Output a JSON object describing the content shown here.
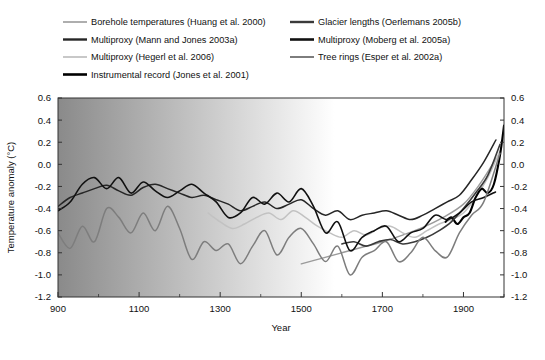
{
  "chart_data": {
    "type": "line",
    "title": "",
    "xlabel": "Year",
    "ylabel": "Temperature anomaly (°C)",
    "xlim": [
      900,
      2000
    ],
    "ylim": [
      -1.2,
      0.6
    ],
    "xticks": [
      900,
      1100,
      1300,
      1500,
      1700,
      1900
    ],
    "xticks_minor": [
      1000,
      1200,
      1400,
      1600,
      1800,
      2000
    ],
    "yticks": [
      0.6,
      0.4,
      0.2,
      0.0,
      -0.2,
      -0.4,
      -0.6,
      -0.8,
      -1.0,
      -1.2
    ],
    "ytick_labels": [
      "0.6",
      "0.4",
      "0.2",
      "0.0",
      "-0.2",
      "-0.4",
      "-0.6",
      "-0.8",
      "-1.0",
      "-1.2"
    ],
    "grid": false,
    "legend_position": "above-plot",
    "background_note": "horizontal grayscale gradient, dark gray at year 900 fading to white by ~1700 (proxy data density)",
    "background_gradient": {
      "from": "#8a8a8a",
      "to": "#ffffff",
      "stop_pct": 62
    },
    "dual_y_axis": true,
    "series": [
      {
        "name": "Borehole temperatures (Huang et al. 2000)",
        "color": "#9a9a9a",
        "width": 1.4,
        "x": [
          1500,
          1550,
          1600,
          1650,
          1700,
          1750,
          1800,
          1850,
          1900,
          1940,
          1980
        ],
        "values": [
          -0.9,
          -0.85,
          -0.8,
          -0.75,
          -0.7,
          -0.64,
          -0.57,
          -0.48,
          -0.36,
          -0.18,
          0.05
        ]
      },
      {
        "name": "Multiproxy (Mann and Jones 2003a)",
        "color": "#262626",
        "width": 1.5,
        "x": [
          900,
          930,
          960,
          990,
          1020,
          1050,
          1080,
          1110,
          1140,
          1170,
          1200,
          1230,
          1260,
          1290,
          1320,
          1350,
          1380,
          1410,
          1440,
          1470,
          1500,
          1530,
          1560,
          1590,
          1620,
          1650,
          1680,
          1710,
          1740,
          1770,
          1800,
          1830,
          1860,
          1890,
          1920,
          1950,
          1980
        ],
        "values": [
          -0.38,
          -0.3,
          -0.26,
          -0.22,
          -0.19,
          -0.24,
          -0.28,
          -0.21,
          -0.18,
          -0.22,
          -0.26,
          -0.3,
          -0.28,
          -0.32,
          -0.36,
          -0.42,
          -0.38,
          -0.34,
          -0.4,
          -0.36,
          -0.32,
          -0.4,
          -0.46,
          -0.42,
          -0.5,
          -0.46,
          -0.44,
          -0.42,
          -0.46,
          -0.5,
          -0.46,
          -0.4,
          -0.34,
          -0.28,
          -0.14,
          0.02,
          0.22
        ]
      },
      {
        "name": "Multiproxy (Hegerl et al. 2006)",
        "color": "#c2c2c2",
        "width": 1.5,
        "x": [
          1270,
          1300,
          1330,
          1360,
          1390,
          1420,
          1450,
          1480,
          1510,
          1540,
          1570,
          1600,
          1630,
          1660,
          1690,
          1720,
          1750,
          1780,
          1810,
          1840,
          1870,
          1900,
          1930,
          1960,
          1990
        ],
        "values": [
          -0.44,
          -0.52,
          -0.58,
          -0.54,
          -0.48,
          -0.44,
          -0.5,
          -0.42,
          -0.48,
          -0.56,
          -0.62,
          -0.66,
          -0.6,
          -0.64,
          -0.58,
          -0.56,
          -0.62,
          -0.66,
          -0.6,
          -0.54,
          -0.5,
          -0.44,
          -0.3,
          -0.12,
          0.12
        ]
      },
      {
        "name": "Instrumental record (Jones et al. 2001)",
        "color": "#000000",
        "width": 2.1,
        "x": [
          1856,
          1870,
          1885,
          1900,
          1915,
          1930,
          1945,
          1960,
          1975,
          1990,
          2000
        ],
        "values": [
          -0.52,
          -0.48,
          -0.54,
          -0.48,
          -0.44,
          -0.3,
          -0.22,
          -0.26,
          -0.18,
          0.08,
          0.35
        ]
      },
      {
        "name": "Glacier lengths (Oerlemans 2005b)",
        "color": "#3a3a3a",
        "width": 1.6,
        "x": [
          1600,
          1630,
          1660,
          1690,
          1720,
          1750,
          1780,
          1810,
          1840,
          1870,
          1900,
          1930,
          1960,
          1990
        ],
        "values": [
          -0.72,
          -0.7,
          -0.74,
          -0.7,
          -0.68,
          -0.72,
          -0.7,
          -0.66,
          -0.6,
          -0.52,
          -0.4,
          -0.26,
          -0.1,
          0.18
        ]
      },
      {
        "name": "Multiproxy (Moberg et al. 2005a)",
        "color": "#111111",
        "width": 1.6,
        "x": [
          900,
          930,
          960,
          990,
          1020,
          1050,
          1080,
          1110,
          1140,
          1170,
          1200,
          1230,
          1260,
          1290,
          1320,
          1350,
          1380,
          1410,
          1440,
          1470,
          1500,
          1530,
          1560,
          1590,
          1620,
          1650,
          1680,
          1710,
          1740,
          1770,
          1800,
          1830,
          1860,
          1890,
          1920,
          1950,
          1979
        ],
        "values": [
          -0.42,
          -0.34,
          -0.18,
          -0.12,
          -0.22,
          -0.12,
          -0.26,
          -0.16,
          -0.24,
          -0.3,
          -0.24,
          -0.18,
          -0.26,
          -0.34,
          -0.48,
          -0.44,
          -0.3,
          -0.36,
          -0.26,
          -0.34,
          -0.22,
          -0.38,
          -0.62,
          -0.52,
          -0.78,
          -0.66,
          -0.6,
          -0.56,
          -0.7,
          -0.62,
          -0.58,
          -0.46,
          -0.5,
          -0.44,
          -0.34,
          -0.3,
          -0.25
        ]
      },
      {
        "name": "Tree rings (Esper et al. 2002a)",
        "color": "#7d7d7d",
        "width": 1.5,
        "x": [
          900,
          930,
          960,
          990,
          1020,
          1050,
          1080,
          1110,
          1140,
          1170,
          1200,
          1230,
          1260,
          1290,
          1320,
          1350,
          1380,
          1410,
          1440,
          1470,
          1500,
          1530,
          1560,
          1590,
          1620,
          1650,
          1680,
          1710,
          1740,
          1770,
          1800,
          1830,
          1860,
          1890,
          1920,
          1950,
          1990
        ],
        "values": [
          -0.62,
          -0.76,
          -0.56,
          -0.7,
          -0.4,
          -0.48,
          -0.62,
          -0.44,
          -0.6,
          -0.38,
          -0.58,
          -0.86,
          -0.7,
          -0.78,
          -0.72,
          -0.9,
          -0.74,
          -0.6,
          -0.82,
          -0.66,
          -0.58,
          -0.72,
          -0.88,
          -0.74,
          -1.0,
          -0.84,
          -0.78,
          -0.7,
          -0.88,
          -0.8,
          -0.66,
          -0.78,
          -0.84,
          -0.62,
          -0.46,
          -0.34,
          0.1
        ]
      }
    ]
  },
  "legend": {
    "columns": [
      [
        {
          "label": "Borehole temperatures (Huang et al. 2000)",
          "color": "#9a9a9a",
          "width": 1.6
        },
        {
          "label": "Multiproxy (Mann and Jones 2003a)",
          "color": "#262626",
          "width": 2.4
        },
        {
          "label": "Multiproxy (Hegerl et al. 2006)",
          "color": "#c2c2c2",
          "width": 1.8
        },
        {
          "label": "Instrumental record (Jones et al. 2001)",
          "color": "#000000",
          "width": 2.6
        }
      ],
      [
        {
          "label": "Glacier lengths (Oerlemans 2005b)",
          "color": "#3a3a3a",
          "width": 2.4
        },
        {
          "label": "Multiproxy (Moberg et al. 2005a)",
          "color": "#111111",
          "width": 2.6
        },
        {
          "label": "Tree rings (Esper et al. 2002a)",
          "color": "#7d7d7d",
          "width": 2.0
        }
      ]
    ]
  }
}
